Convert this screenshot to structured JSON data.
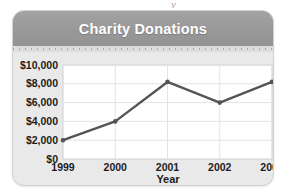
{
  "figure": {
    "card_bg": "#e9e9e9",
    "header_bg": "#989898",
    "title_color": "#ffffff",
    "plot_bg": "#ffffff",
    "grid_color": "#e3e3e3",
    "line_color": "#555555",
    "artifact_text": "y"
  },
  "chart_data": {
    "type": "line",
    "title": "Charity Donations",
    "xlabel": "Year",
    "ylabel": "",
    "categories": [
      "1999",
      "2000",
      "2001",
      "2002",
      "2003"
    ],
    "values": [
      2000,
      4000,
      8200,
      6000,
      8200
    ],
    "series": [
      {
        "name": "Charity Donations",
        "values": [
          2000,
          4000,
          8200,
          6000,
          8200
        ]
      }
    ],
    "ylim": [
      0,
      10000
    ],
    "yticks": [
      0,
      2000,
      4000,
      6000,
      8000,
      10000
    ],
    "ytick_labels": [
      "$0",
      "$2,000",
      "$4,000",
      "$6,000",
      "$8,000",
      "$10,000"
    ],
    "xtick_labels": [
      "1999",
      "2000",
      "2001",
      "2002",
      "2003"
    ],
    "grid": true,
    "legend": false,
    "markers": true,
    "line_color": "#555555"
  }
}
